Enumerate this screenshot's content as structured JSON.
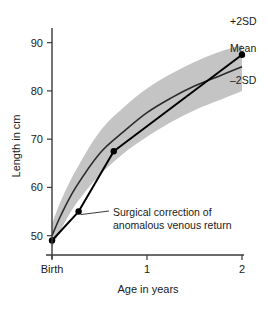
{
  "chart_data": {
    "type": "line",
    "title": "",
    "xlabel": "Age in years",
    "ylabel": "Length in cm",
    "xlim": [
      0,
      2
    ],
    "ylim": [
      46,
      92
    ],
    "grid": false,
    "legend_position": "right-outside",
    "x_ticks": [
      {
        "value": 0,
        "label": "Birth"
      },
      {
        "value": 1,
        "label": "1"
      },
      {
        "value": 2,
        "label": "2"
      }
    ],
    "y_ticks": [
      {
        "value": 50,
        "label": "50"
      },
      {
        "value": 60,
        "label": "60"
      },
      {
        "value": 70,
        "label": "70"
      },
      {
        "value": 80,
        "label": "80"
      },
      {
        "value": 90,
        "label": "90"
      }
    ],
    "series": [
      {
        "name": "+2SD",
        "kind": "reference-band-upper",
        "x": [
          0,
          0.1,
          0.25,
          0.5,
          0.75,
          1.0,
          1.25,
          1.5,
          1.75,
          2.0
        ],
        "values": [
          52.5,
          57.5,
          63.5,
          71.5,
          76.5,
          80.5,
          83.5,
          86.0,
          88.0,
          89.5
        ]
      },
      {
        "name": "Mean",
        "kind": "reference-line",
        "x": [
          0,
          0.1,
          0.25,
          0.5,
          0.75,
          1.0,
          1.25,
          1.5,
          1.75,
          2.0
        ],
        "values": [
          50.0,
          54.5,
          60.0,
          67.0,
          71.5,
          75.5,
          78.5,
          81.0,
          83.0,
          85.0
        ]
      },
      {
        "name": "-2SD",
        "kind": "reference-band-lower",
        "x": [
          0,
          0.1,
          0.25,
          0.5,
          0.75,
          1.0,
          1.25,
          1.5,
          1.75,
          2.0
        ],
        "values": [
          47.5,
          51.5,
          56.5,
          62.5,
          67.0,
          70.5,
          73.5,
          76.0,
          78.0,
          80.0
        ]
      },
      {
        "name": "Patient",
        "kind": "measurement",
        "x": [
          0,
          0.28,
          0.65,
          2.0
        ],
        "values": [
          49.0,
          55.0,
          67.5,
          87.5
        ],
        "markers": true
      }
    ],
    "band_labels": [
      {
        "text": "+2SD"
      },
      {
        "text": "Mean"
      },
      {
        "text": "–2SD"
      }
    ],
    "annotations": [
      {
        "line1": "Surgical correction of",
        "line2": "anomalous venous return",
        "points_to_x": 0.28,
        "points_to_y": 55.0
      }
    ],
    "colors": {
      "band_fill": "#c4c4c4",
      "mean_line": "#2b2b2b",
      "patient_line": "#000000",
      "axis": "#3a3a3a",
      "text": "#1a1a1a"
    }
  }
}
